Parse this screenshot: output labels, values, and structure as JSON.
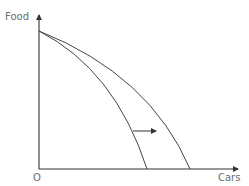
{
  "diagram": {
    "y_axis_label": "Food",
    "x_axis_label": "Cars",
    "origin_label": "O",
    "colors": {
      "axis": "#333333",
      "curve": "#444444",
      "label": "#6b6b6b"
    },
    "curves": [
      {
        "name": "original-ppf",
        "start": [
          39,
          31
        ],
        "end": [
          147,
          169
        ]
      },
      {
        "name": "shifted-ppf",
        "start": [
          39,
          31
        ],
        "end": [
          190,
          169
        ]
      }
    ],
    "shift_arrow": {
      "from": [
        133,
        131
      ],
      "to": [
        156,
        131
      ],
      "direction": "right"
    }
  }
}
